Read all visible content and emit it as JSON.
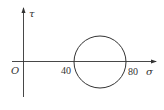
{
  "diagram": {
    "type": "mohr-circle",
    "axes": {
      "x_label": "σ",
      "y_label": "τ",
      "origin_label": "O"
    },
    "ticks": [
      {
        "label": "40",
        "value": 40
      },
      {
        "label": "80",
        "value": 80
      }
    ],
    "circle": {
      "center_sigma": 60,
      "radius": 20,
      "sigma_min": 40,
      "sigma_max": 80
    },
    "colors": {
      "stroke": "#333333",
      "background": "#ffffff"
    }
  }
}
